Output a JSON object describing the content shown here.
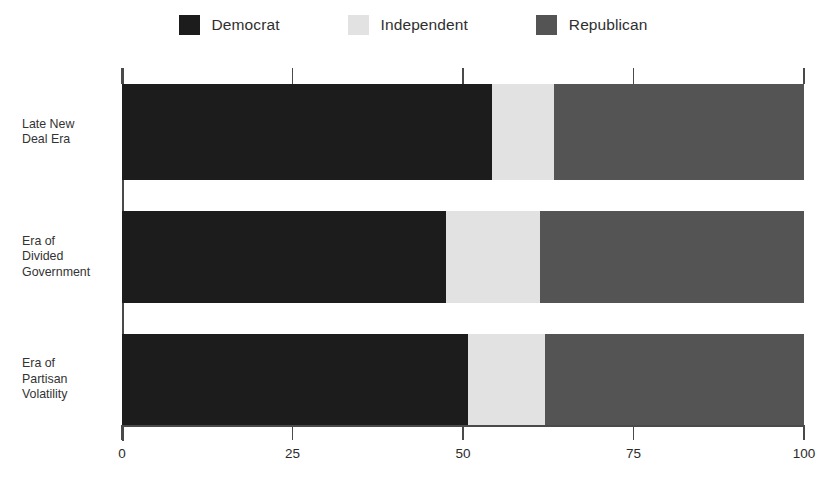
{
  "chart_data": {
    "type": "bar",
    "orientation": "horizontal",
    "stacked": true,
    "normalized_percent": true,
    "title": "",
    "subtitle": "",
    "xlabel": "",
    "ylabel": "",
    "xlim": [
      0,
      100
    ],
    "xticks": [
      0,
      25,
      50,
      75,
      100
    ],
    "xtick_labels": [
      "0",
      "25",
      "50",
      "75",
      "100"
    ],
    "grid": false,
    "legend_position": "top-center",
    "categories": [
      "Late New\nDeal Era",
      "Era of\nDivided\nGovernment",
      "Era of\nPartisan\nVolatility"
    ],
    "series": [
      {
        "name": "Democrat",
        "color": "#1c1c1c",
        "values": [
          54.3,
          47.5,
          50.8
        ]
      },
      {
        "name": "Independent",
        "color": "#e2e2e2",
        "values": [
          9.0,
          13.8,
          11.2
        ]
      },
      {
        "name": "Republican",
        "color": "#545454",
        "values": [
          36.7,
          38.7,
          38.0
        ]
      }
    ],
    "annotations": []
  },
  "legend": {
    "items": [
      {
        "label": "Democrat",
        "color": "#1c1c1c"
      },
      {
        "label": "Independent",
        "color": "#e2e2e2"
      },
      {
        "label": "Republican",
        "color": "#545454"
      }
    ]
  },
  "axis": {
    "x_tick_labels": [
      "0",
      "25",
      "50",
      "75",
      "100"
    ]
  },
  "colors": {
    "democrat": "#1c1c1c",
    "independent": "#e2e2e2",
    "republican": "#545454",
    "axis": "#4a4a4a",
    "text": "#2b2b2b",
    "background": "#ffffff"
  }
}
